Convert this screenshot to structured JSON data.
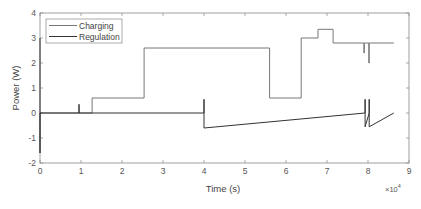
{
  "chart_data": {
    "type": "line",
    "title": "",
    "xlabel": "Time (s)",
    "ylabel": "Power (W)",
    "x_multiplier_label": "×10",
    "x_multiplier_exponent": "4",
    "xlim": [
      0,
      90000
    ],
    "ylim": [
      -2,
      4
    ],
    "xticks": [
      0,
      1,
      2,
      3,
      4,
      5,
      6,
      7,
      8,
      9
    ],
    "xtick_labels": [
      "0",
      "1",
      "2",
      "3",
      "4",
      "5",
      "6",
      "7",
      "8",
      "9"
    ],
    "yticks": [
      -2,
      -1,
      0,
      1,
      2,
      3,
      4
    ],
    "ytick_labels": [
      "-2",
      "-1",
      "0",
      "1",
      "2",
      "3",
      "4"
    ],
    "grid": false,
    "legend_position": "upper left",
    "series": [
      {
        "name": "Charging",
        "color": "#777777",
        "x": [
          0,
          12700,
          12700,
          25400,
          25400,
          56000,
          56000,
          63700,
          63700,
          67800,
          67800,
          71500,
          71500,
          79000,
          79000,
          79100,
          79100,
          80200,
          80200,
          80300,
          80300,
          86300
        ],
        "y": [
          0,
          0,
          0.6,
          0.6,
          2.6,
          2.6,
          0.6,
          0.6,
          3.0,
          3.0,
          3.35,
          3.35,
          2.8,
          2.8,
          2.4,
          2.4,
          2.8,
          2.8,
          2.0,
          2.0,
          2.8,
          2.8
        ]
      },
      {
        "name": "Regulation",
        "color": "#333333",
        "x": [
          0,
          0,
          0,
          9500,
          9500,
          9500,
          40000,
          40000,
          40000,
          79300,
          79300,
          79300,
          80300,
          80300,
          80300,
          86300
        ],
        "y": [
          3.0,
          -1.6,
          0,
          0,
          0.35,
          0,
          0,
          0.55,
          -0.6,
          0,
          0.55,
          -0.55,
          0,
          0.55,
          -0.55,
          0
        ]
      }
    ]
  },
  "legend": {
    "items": [
      {
        "label": "Charging"
      },
      {
        "label": "Regulation"
      }
    ]
  }
}
